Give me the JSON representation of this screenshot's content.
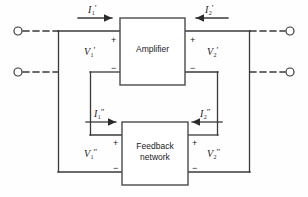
{
  "diagram": {
    "blocks": [
      {
        "id": "amplifier",
        "label": "Amplifier",
        "lines": [
          "Amplifier"
        ]
      },
      {
        "id": "feedback",
        "label": "Feedback network",
        "lines": [
          "Feedback",
          "network"
        ]
      }
    ],
    "currents": [
      {
        "id": "i1p",
        "base": "I",
        "sub": "1",
        "prime": "′",
        "text": "I1′",
        "direction": "right"
      },
      {
        "id": "i2p",
        "base": "I",
        "sub": "2",
        "prime": "′",
        "text": "I2′",
        "direction": "left"
      },
      {
        "id": "i1pp",
        "base": "I",
        "sub": "1",
        "prime": "″",
        "text": "I1″",
        "direction": "right"
      },
      {
        "id": "i2pp",
        "base": "I",
        "sub": "2",
        "prime": "″",
        "text": "I2″",
        "direction": "left"
      }
    ],
    "voltages": [
      {
        "id": "v1p",
        "base": "V",
        "sub": "1",
        "prime": "′",
        "text": "V1′",
        "plus": "+",
        "minus": "−"
      },
      {
        "id": "v2p",
        "base": "V",
        "sub": "2",
        "prime": "′",
        "text": "V2′",
        "plus": "+",
        "minus": "−"
      },
      {
        "id": "v1pp",
        "base": "V",
        "sub": "1",
        "prime": "″",
        "text": "V1″",
        "plus": "+",
        "minus": "−"
      },
      {
        "id": "v2pp",
        "base": "V",
        "sub": "2",
        "prime": "″",
        "text": "V2″",
        "plus": "+",
        "minus": "−"
      }
    ],
    "terminals": [
      {
        "id": "in-top",
        "side": "left",
        "style": "open-circle"
      },
      {
        "id": "in-bottom",
        "side": "left",
        "style": "open-circle"
      },
      {
        "id": "out-top",
        "side": "right",
        "style": "open-circle"
      },
      {
        "id": "out-bottom",
        "side": "right",
        "style": "open-circle"
      }
    ],
    "colors": {
      "wire": "#3a3a3a",
      "box_border": "#4a4a4a",
      "background": "#fefefe",
      "text": "#1a1a1a"
    }
  }
}
